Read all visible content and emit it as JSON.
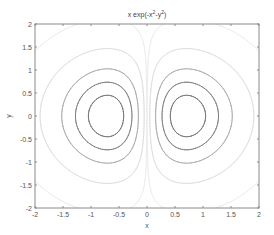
{
  "chart_data": {
    "type": "contour",
    "title_parts": {
      "base": "x exp(-x",
      "sup1": "2",
      "mid": "-y",
      "sup2": "2",
      "end": ")"
    },
    "xlabel": "x",
    "ylabel": "y",
    "xlim": [
      -2,
      2
    ],
    "ylim": [
      -2,
      2
    ],
    "xticks": [
      -2,
      -1.5,
      -1,
      -0.5,
      0,
      0.5,
      1,
      1.5,
      2
    ],
    "xtick_labels": [
      "-2",
      "-1.5",
      "-1",
      "-0.5",
      "0",
      "0.5",
      "1",
      "1.5",
      "2"
    ],
    "yticks": [
      -2,
      -1.5,
      -1,
      -0.5,
      0,
      0.5,
      1,
      1.5,
      2
    ],
    "ytick_labels": [
      "-2",
      "-1.5",
      "-1",
      "-0.5",
      "0",
      "0.5",
      "1",
      "1.5",
      "2"
    ],
    "grid": false,
    "legend": null,
    "function": "z = x * exp(-x^2 - y^2)",
    "extrema": [
      {
        "x": -0.707,
        "y": 0,
        "z": -0.429,
        "kind": "min"
      },
      {
        "x": 0.707,
        "y": 0,
        "z": 0.429,
        "kind": "max"
      }
    ],
    "levels": [
      {
        "z": -0.35,
        "color": "#6e6e6e"
      },
      {
        "z": -0.25,
        "color": "#7a7a7a"
      },
      {
        "z": -0.15,
        "color": "#a8a8a8"
      },
      {
        "z": -0.05,
        "color": "#dcdcdc"
      },
      {
        "z": -0.005,
        "color": "#ececec"
      },
      {
        "z": 0.005,
        "color": "#ececec"
      },
      {
        "z": 0.05,
        "color": "#dcdcdc"
      },
      {
        "z": 0.15,
        "color": "#a8a8a8"
      },
      {
        "z": 0.25,
        "color": "#7a7a7a"
      },
      {
        "z": 0.35,
        "color": "#6e6e6e"
      }
    ]
  },
  "layout": {
    "axes_left": 35,
    "axes_top": 24,
    "axes_right": 259,
    "axes_bottom": 208,
    "frame_color": "#8a8a8a",
    "text_color": "#555555"
  }
}
